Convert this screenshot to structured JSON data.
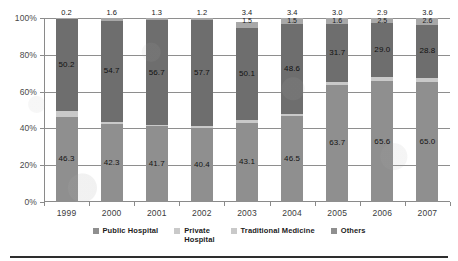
{
  "chart_data": {
    "type": "bar",
    "stacked": true,
    "normalized_percent": true,
    "title": "",
    "subtitle": "",
    "xlabel": "",
    "ylabel": "",
    "categories": [
      "1999",
      "2000",
      "2001",
      "2002",
      "2003",
      "2004",
      "2005",
      "2006",
      "2007"
    ],
    "ylim": [
      0,
      100
    ],
    "ytick_labels": [
      "0%",
      "20%",
      "40%",
      "60%",
      "80%",
      "100%"
    ],
    "ytick_values": [
      0,
      20,
      40,
      60,
      80,
      100
    ],
    "grid": true,
    "grid_axis": "y",
    "legend_position": "bottom",
    "series": [
      {
        "name": "Public Hospital",
        "color": "#8f8f8f",
        "values": [
          46.3,
          42.3,
          41.7,
          40.4,
          43.1,
          46.5,
          63.7,
          65.6,
          65.0
        ],
        "labels": [
          "46.3",
          "42.3",
          "41.7",
          "40.4",
          "43.1",
          "46.5",
          "63.7",
          "65.6",
          "65.0"
        ]
      },
      {
        "name": "Private Hospital",
        "color": "#c9c9c9",
        "values": [
          3.3,
          1.4,
          0.3,
          0.7,
          1.5,
          1.5,
          1.6,
          2.5,
          2.6
        ],
        "labels": [
          "",
          "",
          "",
          "",
          "1.5",
          "1.5",
          "1.6",
          "2.5",
          "2.6"
        ]
      },
      {
        "name": "Traditional Medicine",
        "color": "#6e6e6e",
        "values": [
          50.2,
          54.7,
          56.7,
          57.7,
          50.1,
          48.6,
          31.7,
          29.0,
          28.8
        ],
        "labels": [
          "50.2",
          "54.7",
          "56.7",
          "57.7",
          "50.1",
          "48.6",
          "31.7",
          "29.0",
          "28.8"
        ]
      },
      {
        "name": "Others",
        "color": "#a8a8a8",
        "values": [
          0.2,
          1.6,
          1.3,
          1.2,
          3.4,
          3.4,
          3.0,
          2.9,
          3.6
        ],
        "labels": [
          "0.2",
          "1.6",
          "1.3",
          "1.2",
          "3.4",
          "3.4",
          "3.0",
          "2.9",
          "3.6"
        ]
      }
    ],
    "top_callouts": [
      {
        "category": "1999",
        "primary": "0.2",
        "secondary": ""
      },
      {
        "category": "2000",
        "primary": "1.6",
        "secondary": ""
      },
      {
        "category": "2001",
        "primary": "1.3",
        "secondary": ""
      },
      {
        "category": "2002",
        "primary": "1.2",
        "secondary": ""
      },
      {
        "category": "2003",
        "primary": "3.4",
        "secondary": "1.5"
      },
      {
        "category": "2004",
        "primary": "3.4",
        "secondary": "1.5"
      },
      {
        "category": "2005",
        "primary": "3.0",
        "secondary": "1.6"
      },
      {
        "category": "2006",
        "primary": "2.9",
        "secondary": "2.5"
      },
      {
        "category": "2007",
        "primary": "3.6",
        "secondary": "2.6"
      }
    ]
  },
  "legend": {
    "items": [
      {
        "label": "Public Hospital",
        "color": "#8f8f8f"
      },
      {
        "label": "Private\nHospital",
        "color": "#c9c9c9"
      },
      {
        "label": "Traditional Medicine",
        "color": "#c9c9c9"
      },
      {
        "label": "Others",
        "color": "#8f8f8f"
      }
    ]
  },
  "axis": {
    "y_labels": [
      "100%",
      "80%",
      "60%",
      "40%",
      "20%",
      "0%"
    ]
  }
}
